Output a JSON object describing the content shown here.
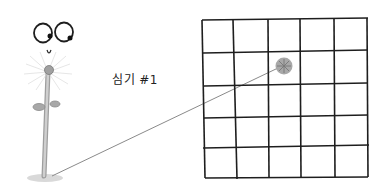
{
  "illustration": {
    "label": "심기 #1",
    "character": "sprout-with-eyes",
    "grid": {
      "rows": 5,
      "cols": 5,
      "marked_cell": {
        "row": 2,
        "col": 3
      }
    },
    "colors": {
      "ink": "#1e1e1e",
      "stem": "#bdbdbd",
      "marker": "#9a9a9a",
      "connector": "#8a8a8a"
    }
  }
}
